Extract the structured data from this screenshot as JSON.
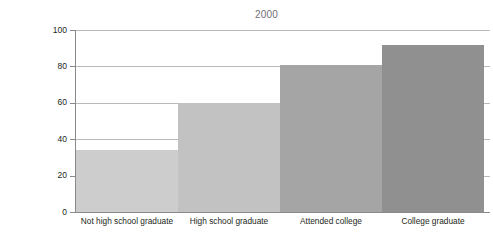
{
  "chart_data": {
    "type": "bar",
    "title": "2000",
    "xlabel": "",
    "ylabel": "",
    "categories": [
      "Not high school graduate",
      "High school graduate",
      "Attended college",
      "College graduate"
    ],
    "values": [
      34,
      60,
      81,
      92
    ],
    "series": [
      {
        "name": "2000",
        "values": [
          34,
          60,
          81,
          92
        ]
      }
    ],
    "bar_colors": [
      "#cdcdcd",
      "#c2c2c2",
      "#a5a5a5",
      "#909090"
    ],
    "ylim": [
      0,
      100
    ],
    "yticks": [
      0,
      20,
      40,
      60,
      80,
      100
    ],
    "ytick_labels": [
      "0",
      "20",
      "40",
      "60",
      "80",
      "100"
    ],
    "grid": true,
    "grid_axis": "y",
    "grid_color": "#b9b9bb",
    "legend": false,
    "legend_position": "none",
    "bar_gap": 0,
    "axis_color": "#8a8a8c",
    "text_color": "#231f20",
    "background": "#ffffff"
  }
}
